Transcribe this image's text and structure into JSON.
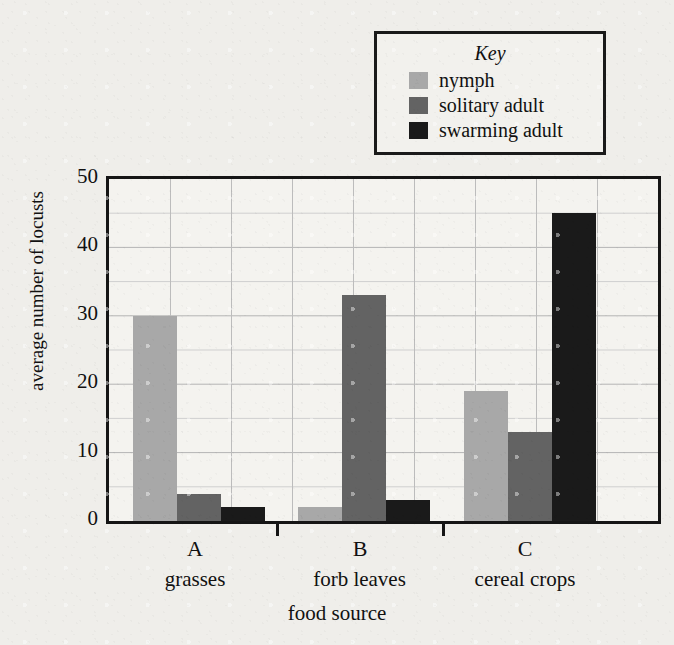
{
  "chart_data": {
    "type": "bar",
    "title": "",
    "xlabel": "food source",
    "ylabel": "average number of locusts",
    "categories": [
      "A",
      "B",
      "C"
    ],
    "category_names": [
      "grasses",
      "forb leaves",
      "cereal crops"
    ],
    "series": [
      {
        "name": "nymph",
        "color": "#a8a8a8",
        "values": [
          30,
          2,
          19
        ]
      },
      {
        "name": "solitary adult",
        "color": "#636363",
        "values": [
          4,
          33,
          13
        ]
      },
      {
        "name": "swarming adult",
        "color": "#1a1a1a",
        "values": [
          2,
          3,
          45
        ]
      }
    ],
    "ylim": [
      0,
      50
    ],
    "y_major_ticks": [
      0,
      10,
      20,
      30,
      40,
      50
    ],
    "y_minor_interval": 5,
    "grid": true,
    "legend_position": "top-right",
    "legend_title": "Key"
  },
  "legend": {
    "title": "Key",
    "entries": [
      {
        "label": "nymph",
        "color": "#a8a8a8"
      },
      {
        "label": "solitary adult",
        "color": "#636363"
      },
      {
        "label": "swarming adult",
        "color": "#1a1a1a"
      }
    ]
  },
  "axes": {
    "y_title": "average number of locusts",
    "x_title": "food source",
    "y_tick_labels": [
      "50",
      "40",
      "30",
      "20",
      "10",
      "0"
    ],
    "groups": [
      {
        "letter": "A",
        "name": "grasses"
      },
      {
        "letter": "B",
        "name": "forb leaves"
      },
      {
        "letter": "C",
        "name": "cereal crops"
      }
    ]
  }
}
